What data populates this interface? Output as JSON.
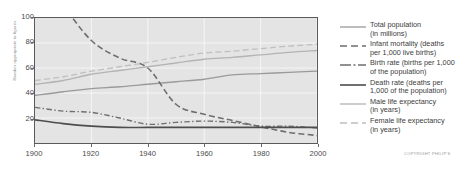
{
  "axes": {
    "ylabel": "Number appropriate to figures",
    "yticks": [
      20,
      40,
      60,
      80,
      100
    ],
    "xticks": [
      1900,
      1920,
      1940,
      1960,
      1980,
      2000
    ],
    "ylim": [
      0,
      100
    ],
    "xlim": [
      1900,
      2000
    ]
  },
  "legend": {
    "items": [
      {
        "line1": "Total population",
        "line2": "(in millions)",
        "style": "solid",
        "color": "#9a9a9a",
        "width": 1.3
      },
      {
        "line1": "Infant mortality (deaths",
        "line2": "per 1,000 live births)",
        "style": "dash",
        "color": "#6e6e6e",
        "width": 1.6
      },
      {
        "line1": "Birth rate (births per 1,000",
        "line2": "of the population)",
        "style": "dashdot",
        "color": "#6e6e6e",
        "width": 1.4
      },
      {
        "line1": "Death rate (deaths per",
        "line2": "1,000 of the population)",
        "style": "solid",
        "color": "#4d4d4d",
        "width": 1.6
      },
      {
        "line1": "Male life expectancy",
        "line2": "(in years)",
        "style": "solid",
        "color": "#b4b4b4",
        "width": 1.3
      },
      {
        "line1": "Female life expectancy",
        "line2": "(in years)",
        "style": "dash",
        "color": "#bfbfbf",
        "width": 1.3
      }
    ]
  },
  "copyright": "COPYRIGHT PHILIP'S",
  "colors": {
    "plot_background": "#e4e4e4",
    "gridline": "#f6f6f6",
    "axis": "#5a5a5a",
    "tick_text": "#4a4a4a"
  },
  "chart_data": {
    "type": "line",
    "title": "",
    "subtitle": "",
    "xlabel": "",
    "ylabel": "Number appropriate to figures",
    "xlim": [
      1900,
      2000
    ],
    "ylim": [
      0,
      100
    ],
    "xticks": [
      1900,
      1920,
      1940,
      1960,
      1980,
      2000
    ],
    "yticks": [
      20,
      40,
      60,
      80,
      100
    ],
    "grid": true,
    "legend_position": "right",
    "x": [
      1900,
      1910,
      1920,
      1930,
      1940,
      1950,
      1960,
      1970,
      1980,
      1990,
      2000
    ],
    "series": [
      {
        "name": "Total population (in millions)",
        "style": "solid",
        "color": "#9a9a9a",
        "values": [
          38,
          41,
          43.5,
          45,
          47,
          49,
          51,
          54.5,
          55.5,
          56.5,
          57.5
        ]
      },
      {
        "name": "Infant mortality (deaths per 1,000 live births)",
        "style": "dash",
        "color": "#6e6e6e",
        "values": [
          140,
          110,
          82,
          68,
          60,
          31,
          23,
          18,
          13,
          8.5,
          6
        ]
      },
      {
        "name": "Birth rate (births per 1,000 of the population)",
        "style": "dashdot",
        "color": "#6e6e6e",
        "values": [
          28.5,
          25.5,
          24.5,
          20,
          15,
          16.5,
          17.5,
          16.5,
          13.5,
          13.5,
          12
        ]
      },
      {
        "name": "Death rate (deaths per 1,000 of the population)",
        "style": "solid",
        "color": "#4d4d4d",
        "values": [
          18.5,
          15.5,
          13.5,
          12.5,
          12.5,
          12.5,
          12.5,
          12.5,
          12.5,
          12.5,
          12.5
        ]
      },
      {
        "name": "Male life expectancy (in years)",
        "style": "solid",
        "color": "#b4b4b4",
        "values": [
          47,
          50,
          55,
          58,
          61,
          64,
          67,
          68.5,
          70.5,
          72.5,
          74
        ]
      },
      {
        "name": "Female life expectancy (in years)",
        "style": "dash",
        "color": "#bfbfbf",
        "values": [
          50,
          53,
          57.5,
          61,
          64.5,
          68.5,
          72,
          73.5,
          75.5,
          77.5,
          79
        ]
      }
    ]
  }
}
